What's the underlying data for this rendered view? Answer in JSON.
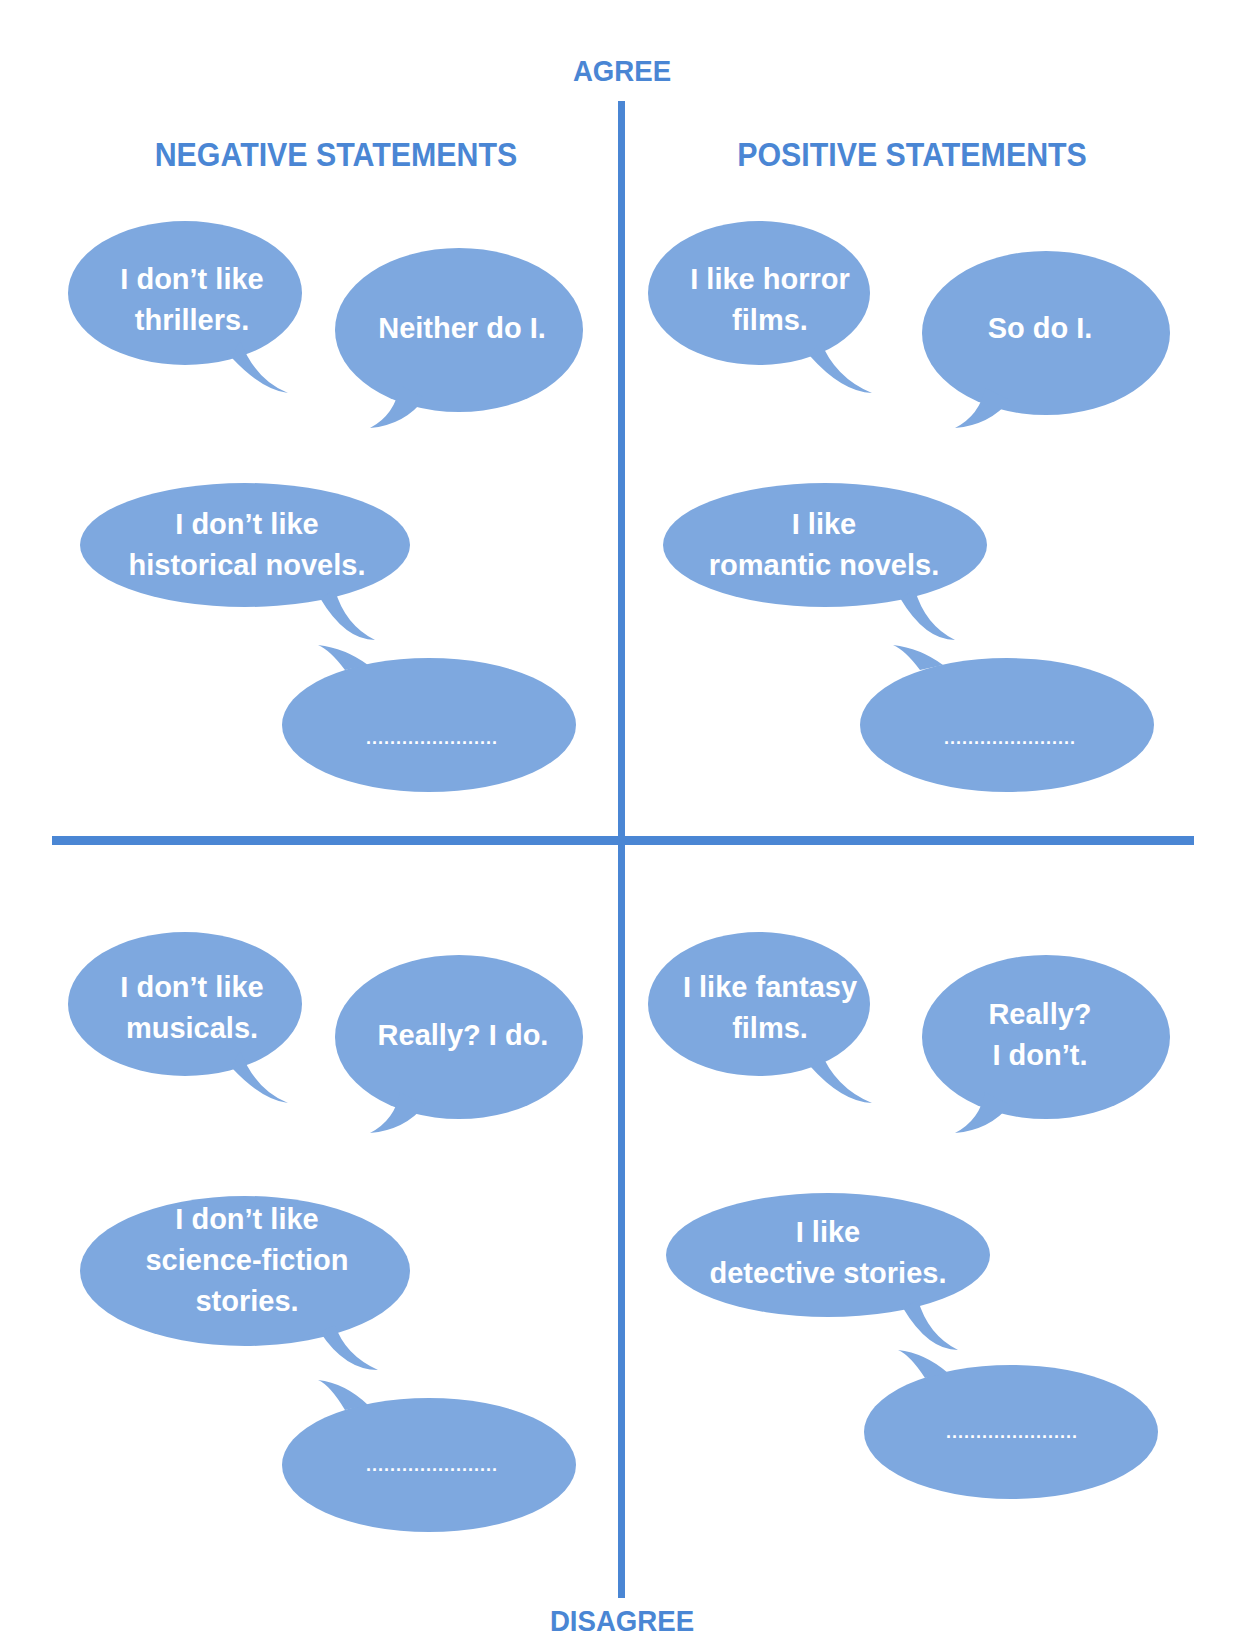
{
  "axes": {
    "top_label": "AGREE",
    "bottom_label": "DISAGREE",
    "line_color": "#4a86d4"
  },
  "columns": {
    "left_title": "NEGATIVE STATEMENTS",
    "right_title": "POSITIVE STATEMENTS"
  },
  "bubble_color": "#7ea8df",
  "quadrants": {
    "agree_negative": {
      "exchange": {
        "statement": [
          "I don’t like",
          "thrillers."
        ],
        "response": [
          "Neither do I."
        ]
      },
      "prompt": {
        "statement": [
          "I don’t like",
          "historical novels."
        ],
        "answer_blank": "......................"
      }
    },
    "agree_positive": {
      "exchange": {
        "statement": [
          "I like horror",
          "films."
        ],
        "response": [
          "So do I."
        ]
      },
      "prompt": {
        "statement": [
          "I like",
          "romantic novels."
        ],
        "answer_blank": "......................"
      }
    },
    "disagree_negative": {
      "exchange": {
        "statement": [
          "I don’t like",
          "musicals."
        ],
        "response": [
          "Really? I do."
        ]
      },
      "prompt": {
        "statement": [
          "I don’t like",
          "science-fiction",
          "stories."
        ],
        "answer_blank": "......................"
      }
    },
    "disagree_positive": {
      "exchange": {
        "statement": [
          "I like fantasy",
          "films."
        ],
        "response": [
          "Really?",
          "I don’t."
        ]
      },
      "prompt": {
        "statement": [
          "I like",
          "detective stories."
        ],
        "answer_blank": "......................"
      }
    }
  }
}
